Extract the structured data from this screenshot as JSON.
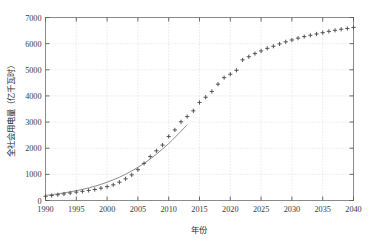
{
  "chart_data": {
    "type": "line",
    "title": "",
    "xlabel": "年份",
    "ylabel": "全社会用电量（亿千瓦时）",
    "xlim": [
      1990,
      2040
    ],
    "ylim": [
      0,
      7000
    ],
    "xticks": [
      1990,
      1995,
      2000,
      2005,
      2010,
      2015,
      2020,
      2025,
      2030,
      2035,
      2040
    ],
    "yticks": [
      0,
      1000,
      2000,
      3000,
      4000,
      5000,
      6000,
      7000
    ],
    "grid": true,
    "legend": "none",
    "marker": "plus",
    "marker_color": "#4d4d4d",
    "line_color": "#808080",
    "series": [
      {
        "name": "历史与预测数据点",
        "style": "markers",
        "x": [
          1990,
          1991,
          1992,
          1993,
          1994,
          1995,
          1996,
          1997,
          1998,
          1999,
          2000,
          2001,
          2002,
          2003,
          2004,
          2005,
          2006,
          2007,
          2008,
          2009,
          2010,
          2011,
          2012,
          2013,
          2014,
          2015,
          2016,
          2017,
          2018,
          2019,
          2020,
          2021,
          2022,
          2023,
          2024,
          2025,
          2026,
          2027,
          2028,
          2029,
          2030,
          2031,
          2032,
          2033,
          2034,
          2035,
          2036,
          2037,
          2038,
          2039,
          2040
        ],
        "y": [
          160,
          190,
          220,
          250,
          285,
          320,
          350,
          385,
          420,
          470,
          530,
          600,
          700,
          830,
          980,
          1180,
          1420,
          1680,
          1900,
          2120,
          2450,
          2700,
          3010,
          3210,
          3430,
          3750,
          3950,
          4170,
          4450,
          4700,
          4830,
          4980,
          5380,
          5500,
          5620,
          5720,
          5820,
          5900,
          5990,
          6070,
          6140,
          6210,
          6270,
          6320,
          6370,
          6420,
          6470,
          6510,
          6550,
          6580,
          6620
        ]
      },
      {
        "name": "拟合曲线",
        "style": "line",
        "x": [
          1990,
          1992,
          1994,
          1996,
          1998,
          2000,
          2002,
          2004,
          2006,
          2008,
          2010,
          2012,
          2013
        ],
        "y": [
          195,
          255,
          330,
          425,
          545,
          700,
          890,
          1130,
          1420,
          1770,
          2180,
          2650,
          2900
        ]
      }
    ]
  },
  "axis": {
    "x_tick_labels": [
      "1990",
      "1995",
      "2000",
      "2005",
      "2010",
      "2015",
      "2020",
      "2025",
      "2030",
      "2035",
      "2040"
    ],
    "y_tick_labels": [
      "0",
      "1000",
      "2000",
      "3000",
      "4000",
      "5000",
      "6000",
      "7000"
    ]
  }
}
